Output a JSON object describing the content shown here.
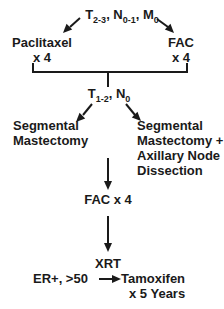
{
  "canvas": {
    "width": 224,
    "height": 309,
    "background_color": "#ffffff",
    "ink_color": "#1a1a1a"
  },
  "diagram": {
    "stage1": {
      "classification_parts": [
        {
          "t": "T"
        },
        {
          "s": "2-3"
        },
        {
          "t": ", N"
        },
        {
          "s": "0-1"
        },
        {
          "t": ", M"
        },
        {
          "s": "0"
        }
      ],
      "left_arm": {
        "name": "Paclitaxel",
        "cycles": "x 4"
      },
      "right_arm": {
        "name": "FAC",
        "cycles": "x 4"
      }
    },
    "stage2": {
      "classification_parts": [
        {
          "t": "T"
        },
        {
          "s": "1-2"
        },
        {
          "t": ", N"
        },
        {
          "s": "0"
        }
      ],
      "left_arm_lines": [
        "Segmental",
        "Mastectomy"
      ],
      "right_arm_lines": [
        "Segmental",
        "Mastectomy +",
        "Axillary Node",
        "Dissection"
      ]
    },
    "chemo_step": "FAC x 4",
    "radiation_step": "XRT",
    "endocrine_step": {
      "condition": "ER+, >50",
      "therapy_name": "Tamoxifen",
      "therapy_duration": "x 5 Years"
    }
  }
}
